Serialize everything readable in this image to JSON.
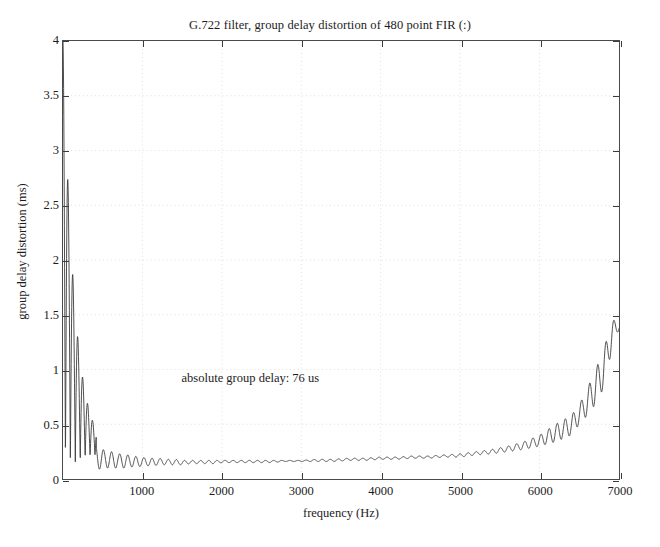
{
  "chart_data": {
    "type": "line",
    "title": "G.722 filter, group delay distortion of 480 point FIR (:)",
    "xlabel": "frequency (Hz)",
    "ylabel": "group delay distortion (ms)",
    "xlim": [
      0,
      7000
    ],
    "ylim": [
      0,
      4
    ],
    "grid": true,
    "legend": null,
    "xticks": [
      1000,
      2000,
      3000,
      4000,
      5000,
      6000,
      7000
    ],
    "xtick_labels": [
      "1000",
      "2000",
      "3000",
      "4000",
      "5000",
      "6000",
      "7000"
    ],
    "yticks": [
      0,
      0.5,
      1,
      1.5,
      2,
      2.5,
      3,
      3.5,
      4
    ],
    "ytick_labels": [
      "0",
      "0.5",
      "1",
      "1.5",
      "2",
      "2.5",
      "3",
      "3.5",
      "4"
    ],
    "annotations": [
      {
        "text": "absolute group delay: 76 us",
        "x": 1500,
        "y": 0.92
      }
    ],
    "series": [
      {
        "name": "group delay distortion",
        "color": "#3a3a3a",
        "linewidth": 0.9,
        "comment": "Rapidly decaying ripple at low frequency from a clipped spike at f=0 reaching above 4 ms, settling to ~0.15 ms plateau around 1500-3000 Hz, then slowly rising and turning up sharply near the band edge to a peak of ~1.45 ms at ~6950 Hz.",
        "x": [
          0,
          30,
          60,
          95,
          120,
          150,
          175,
          200,
          225,
          250,
          275,
          300,
          325,
          350,
          375,
          400,
          430,
          460,
          490,
          520,
          550,
          580,
          610,
          640,
          670,
          700,
          740,
          780,
          820,
          860,
          900,
          950,
          1000,
          1050,
          1100,
          1150,
          1200,
          1300,
          1400,
          1500,
          1600,
          1700,
          1800,
          1900,
          2000,
          2200,
          2400,
          2600,
          2800,
          3000,
          3200,
          3400,
          3600,
          3800,
          4000,
          4200,
          4400,
          4600,
          4800,
          5000,
          5200,
          5400,
          5600,
          5800,
          6000,
          6200,
          6400,
          6500,
          6600,
          6700,
          6800,
          6850,
          6900,
          6950,
          7000
        ],
        "y": [
          4.0,
          2.1,
          0.4,
          1.22,
          0.18,
          0.88,
          0.12,
          0.62,
          0.1,
          0.48,
          0.09,
          0.41,
          0.09,
          0.35,
          0.09,
          0.31,
          0.09,
          0.28,
          0.09,
          0.26,
          0.1,
          0.25,
          0.1,
          0.24,
          0.1,
          0.23,
          0.1,
          0.22,
          0.11,
          0.21,
          0.11,
          0.2,
          0.12,
          0.19,
          0.12,
          0.19,
          0.13,
          0.18,
          0.13,
          0.17,
          0.14,
          0.17,
          0.14,
          0.17,
          0.15,
          0.17,
          0.15,
          0.17,
          0.16,
          0.17,
          0.16,
          0.18,
          0.17,
          0.19,
          0.18,
          0.2,
          0.19,
          0.21,
          0.2,
          0.22,
          0.23,
          0.25,
          0.27,
          0.3,
          0.34,
          0.4,
          0.5,
          0.58,
          0.68,
          0.82,
          1.0,
          1.14,
          1.3,
          1.45,
          1.36
        ]
      }
    ]
  }
}
